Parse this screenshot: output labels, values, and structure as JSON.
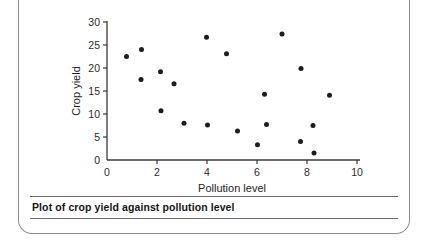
{
  "caption": {
    "text": "Plot of crop yield against pollution level"
  },
  "chart_data": {
    "type": "scatter",
    "title": "",
    "xlabel": "Pollution level",
    "ylabel": "Crop yield",
    "xlim": [
      0,
      10
    ],
    "ylim": [
      0,
      30
    ],
    "xticks": [
      0,
      2,
      4,
      6,
      8,
      10
    ],
    "yticks": [
      0,
      5,
      10,
      15,
      20,
      25,
      30
    ],
    "xtick_labels": [
      "0",
      "2",
      "4",
      "6",
      "8",
      "10"
    ],
    "ytick_labels": [
      "0",
      "5",
      "10",
      "15",
      "20",
      "25",
      "30"
    ],
    "grid": false,
    "legend": null,
    "marker": "filled-circle",
    "marker_color": "#1d1d1d",
    "points": [
      {
        "x": 0.78,
        "y": 22.5
      },
      {
        "x": 1.38,
        "y": 24.0
      },
      {
        "x": 1.36,
        "y": 17.5
      },
      {
        "x": 2.14,
        "y": 19.2
      },
      {
        "x": 2.16,
        "y": 10.7
      },
      {
        "x": 2.68,
        "y": 16.6
      },
      {
        "x": 3.08,
        "y": 8.0
      },
      {
        "x": 3.98,
        "y": 26.7
      },
      {
        "x": 4.02,
        "y": 7.6
      },
      {
        "x": 4.78,
        "y": 23.1
      },
      {
        "x": 5.22,
        "y": 6.3
      },
      {
        "x": 6.02,
        "y": 3.3
      },
      {
        "x": 6.3,
        "y": 14.3
      },
      {
        "x": 6.38,
        "y": 7.7
      },
      {
        "x": 7.0,
        "y": 27.4
      },
      {
        "x": 7.76,
        "y": 19.9
      },
      {
        "x": 7.74,
        "y": 4.0
      },
      {
        "x": 8.24,
        "y": 7.5
      },
      {
        "x": 8.28,
        "y": 1.5
      },
      {
        "x": 8.9,
        "y": 14.1
      }
    ]
  }
}
